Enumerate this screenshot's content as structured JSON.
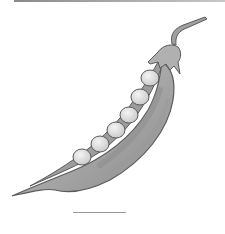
{
  "image": {
    "subject": "pea pod illustration",
    "style": "grayscale drawing",
    "pea_count": 6
  },
  "colors": {
    "background": "#ffffff",
    "outline": "#5a5a5a",
    "pod_fill": "#a8a8a8",
    "pod_shadow": "#8c8c8c",
    "pod_highlight": "#c4c4c4",
    "pea_fill": "#dcdcdc",
    "pea_highlight": "#f2f2f2",
    "stem": "#9a9a9a"
  }
}
